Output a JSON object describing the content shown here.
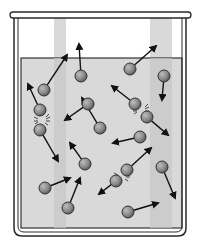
{
  "figure": {
    "colors": {
      "background": "#ffffff",
      "beaker_outline": "#2a2a2a",
      "liquid": "#d6d6d6",
      "glass_highlight": "#c8c8c8",
      "molecule_fill": "#8a8a8a",
      "molecule_stroke": "#333333",
      "arrow": "#111111"
    },
    "molecules": [
      {
        "cx": 40,
        "cy": 110,
        "ax": 28,
        "ay": 84
      },
      {
        "cx": 44,
        "cy": 90,
        "ax": 67,
        "ay": 55
      },
      {
        "cx": 81,
        "cy": 76,
        "ax": 79,
        "ay": 44
      },
      {
        "cx": 40,
        "cy": 130,
        "ax": 58,
        "ay": 161
      },
      {
        "cx": 45,
        "cy": 188,
        "ax": 70,
        "ay": 178
      },
      {
        "cx": 68,
        "cy": 208,
        "ax": 80,
        "ay": 178
      },
      {
        "cx": 88,
        "cy": 104,
        "ax": 65,
        "ay": 120
      },
      {
        "cx": 85,
        "cy": 164,
        "ax": 70,
        "ay": 143
      },
      {
        "cx": 130,
        "cy": 69,
        "ax": 156,
        "ay": 46
      },
      {
        "cx": 164,
        "cy": 76,
        "ax": 162,
        "ay": 100
      },
      {
        "cx": 135,
        "cy": 104,
        "ax": 112,
        "ay": 86
      },
      {
        "cx": 147,
        "cy": 117,
        "ax": 168,
        "ay": 135
      },
      {
        "cx": 140,
        "cy": 137,
        "ax": 113,
        "ay": 143
      },
      {
        "cx": 127,
        "cy": 170,
        "ax": 151,
        "ay": 148
      },
      {
        "cx": 116,
        "cy": 181,
        "ax": 99,
        "ay": 194
      },
      {
        "cx": 162,
        "cy": 167,
        "ax": 175,
        "ay": 198
      },
      {
        "cx": 128,
        "cy": 212,
        "ax": 158,
        "ay": 203
      },
      {
        "cx": 100,
        "cy": 128,
        "ax": 82,
        "ay": 98
      }
    ],
    "collisions": [
      {
        "x": 42,
        "y": 120
      },
      {
        "x": 141,
        "y": 110
      },
      {
        "x": 122,
        "y": 176
      }
    ]
  }
}
